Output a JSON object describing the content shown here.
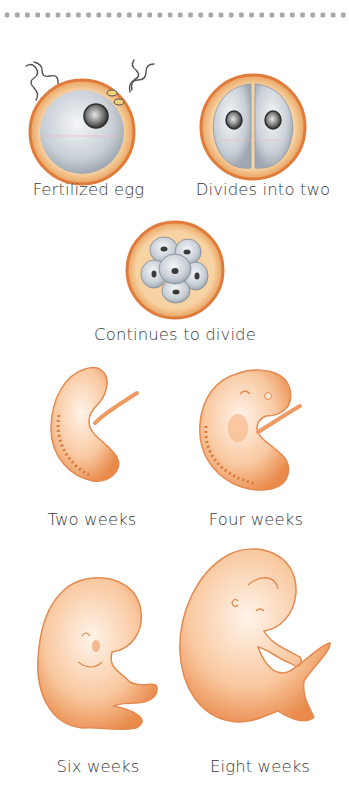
{
  "diagram": {
    "stages": [
      {
        "id": "fertilized-egg",
        "label": "Fertilized egg"
      },
      {
        "id": "two-cell",
        "label": "Divides into two"
      },
      {
        "id": "morula",
        "label": "Continues to divide"
      },
      {
        "id": "two-weeks",
        "label": "Two weeks"
      },
      {
        "id": "four-weeks",
        "label": "Four weeks"
      },
      {
        "id": "six-weeks",
        "label": "Six weeks"
      },
      {
        "id": "eight-weeks",
        "label": "Eight weeks"
      }
    ],
    "colors": {
      "membrane": "#e08a4a",
      "zona": "#f2c48e",
      "cell": "#c7ced6",
      "nucleus": "#4a4a4a",
      "embryo": "#f1a36c",
      "embryo_light": "#fde6d2",
      "sperm": "#555555",
      "text": "#3a3a3a",
      "divider_dots": "#a8a8a8"
    }
  }
}
